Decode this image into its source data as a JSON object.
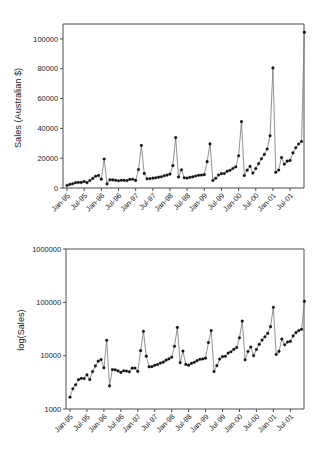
{
  "figure": {
    "panels": [
      "top",
      "bottom"
    ]
  },
  "chart_data": [
    {
      "id": "sales-linear",
      "type": "line",
      "title": "",
      "xlabel": "",
      "ylabel": "Sales (Australian $)",
      "ylim": [
        0,
        110000
      ],
      "yticks": [
        0,
        20000,
        40000,
        60000,
        80000,
        100000
      ],
      "yticklabels": [
        "0",
        "20000",
        "40000",
        "60000",
        "80000",
        "100000"
      ],
      "yscale": "linear",
      "grid": false,
      "legend": "none",
      "xticklabels": [
        "Jan-95",
        "Jul-95",
        "Jan-96",
        "Jul-96",
        "Jan-97",
        "Jul-97",
        "Jan-98",
        "Jul-98",
        "Jan-99",
        "Jul-99",
        "Jan-00",
        "Jul-00",
        "Jan-01",
        "Jul-01"
      ],
      "xtick_period_months": 6,
      "x": [
        "1995-01",
        "1995-02",
        "1995-03",
        "1995-04",
        "1995-05",
        "1995-06",
        "1995-07",
        "1995-08",
        "1995-09",
        "1995-10",
        "1995-11",
        "1995-12",
        "1996-01",
        "1996-02",
        "1996-03",
        "1996-04",
        "1996-05",
        "1996-06",
        "1996-07",
        "1996-08",
        "1996-09",
        "1996-10",
        "1996-11",
        "1996-12",
        "1997-01",
        "1997-02",
        "1997-03",
        "1997-04",
        "1997-05",
        "1997-06",
        "1997-07",
        "1997-08",
        "1997-09",
        "1997-10",
        "1997-11",
        "1997-12",
        "1998-01",
        "1998-02",
        "1998-03",
        "1998-04",
        "1998-05",
        "1998-06",
        "1998-07",
        "1998-08",
        "1998-09",
        "1998-10",
        "1998-11",
        "1998-12",
        "1999-01",
        "1999-02",
        "1999-03",
        "1999-04",
        "1999-05",
        "1999-06",
        "1999-07",
        "1999-08",
        "1999-09",
        "1999-10",
        "1999-11",
        "1999-12",
        "2000-01",
        "2000-02",
        "2000-03",
        "2000-04",
        "2000-05",
        "2000-06",
        "2000-07",
        "2000-08",
        "2000-09",
        "2000-10",
        "2000-11",
        "2000-12",
        "2001-01",
        "2001-02",
        "2001-03",
        "2001-04",
        "2001-05",
        "2001-06",
        "2001-07",
        "2001-08",
        "2001-09",
        "2001-10",
        "2001-11",
        "2001-12"
      ],
      "values": [
        1665,
        2397,
        2840,
        3547,
        3752,
        3714,
        4349,
        3566,
        5021,
        6423,
        7873,
        8460,
        5911,
        19439,
        2704,
        5502,
        5430,
        5177,
        4842,
        5213,
        5140,
        4980,
        5821,
        5854,
        5066,
        12421,
        28541,
        9775,
        6187,
        6229,
        6589,
        6826,
        7273,
        7560,
        8228,
        8673,
        9349,
        15005,
        33813,
        7392,
        12210,
        6843,
        6647,
        7155,
        7503,
        8058,
        8531,
        8672,
        8970,
        17625,
        29589,
        5040,
        6507,
        8637,
        9595,
        9722,
        11193,
        11838,
        13094,
        14157,
        21632,
        44505,
        8350,
        11971,
        14501,
        10000,
        13061,
        16322,
        19600,
        22547,
        26160,
        35000,
        80515,
        10530,
        12032,
        20450,
        16000,
        17990,
        18500,
        23500,
        27000,
        29500,
        31200,
        46500
      ],
      "peaks": [
        {
          "x": "1995-12",
          "value": 8460
        },
        {
          "x": "1996-02",
          "value": 19439
        },
        {
          "x": "1997-03",
          "value": 28541
        },
        {
          "x": "1998-03",
          "value": 33813
        },
        {
          "x": "1999-03",
          "value": 29589
        },
        {
          "x": "2000-02",
          "value": 44505
        },
        {
          "x": "2001-01",
          "value": 80515
        },
        {
          "x": "2001-12",
          "value": 104500
        }
      ],
      "final_value": 104500
    },
    {
      "id": "sales-log",
      "type": "line",
      "title": "",
      "xlabel": "",
      "ylabel": "log(Sales)",
      "yscale": "log",
      "ylim": [
        1000,
        1000000
      ],
      "yticks": [
        1000,
        10000,
        100000,
        1000000
      ],
      "yticklabels": [
        "1000",
        "10000",
        "100000",
        "1000000"
      ],
      "grid": false,
      "legend": "none",
      "xticklabels": [
        "Jan-95",
        "Jul-95",
        "Jan-96",
        "Jul-96",
        "Jan-97",
        "Jul-97",
        "Jan-98",
        "Jul-98",
        "Jan-99",
        "Jul-99",
        "Jan-00",
        "Jul-00",
        "Jan-01",
        "Jul-01"
      ],
      "xtick_period_months": 6,
      "note": "Same series as upper panel, plotted on a base-10 logarithmic vertical axis",
      "values": [
        1665,
        2397,
        2840,
        3547,
        3752,
        3714,
        4349,
        3566,
        5021,
        6423,
        7873,
        8460,
        5911,
        19439,
        2704,
        5502,
        5430,
        5177,
        4842,
        5213,
        5140,
        4980,
        5821,
        5854,
        5066,
        12421,
        28541,
        9775,
        6187,
        6229,
        6589,
        6826,
        7273,
        7560,
        8228,
        8673,
        9349,
        15005,
        33813,
        7392,
        12210,
        6843,
        6647,
        7155,
        7503,
        8058,
        8531,
        8672,
        8970,
        17625,
        29589,
        5040,
        6507,
        8637,
        9595,
        9722,
        11193,
        11838,
        13094,
        14157,
        21632,
        44505,
        8350,
        11971,
        14501,
        10000,
        13061,
        16322,
        19600,
        22547,
        26160,
        35000,
        80515,
        10530,
        12032,
        20450,
        16000,
        17990,
        18500,
        23500,
        27000,
        29500,
        31200,
        46500
      ],
      "final_value": 104500
    }
  ]
}
